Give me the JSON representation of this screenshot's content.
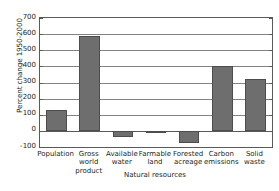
{
  "chart_data": {
    "type": "bar",
    "title": "",
    "subtitle": "",
    "xlabel": "",
    "ylabel": "Percent change 1950-2000",
    "ylim": [
      -100,
      700
    ],
    "ytick_step": 100,
    "yticks": [
      700,
      600,
      500,
      400,
      300,
      200,
      100,
      0,
      -100
    ],
    "ytick_labels": [
      "700",
      "600",
      "500",
      "400",
      "300",
      "200",
      "100",
      "0",
      "-100"
    ],
    "grid": true,
    "grid_axis": "y",
    "legend": false,
    "legend_position": "none",
    "categories": [
      "Population",
      "Gross world product",
      "Available water",
      "Farmable land",
      "Forested acreage",
      "Carbon emissions",
      "Solid waste"
    ],
    "category_label_lines": [
      [
        "Population"
      ],
      [
        "Gross",
        "world",
        "product"
      ],
      [
        "Available",
        "water"
      ],
      [
        "Farmable",
        "land"
      ],
      [
        "Forested",
        "acreage"
      ],
      [
        "Carbon",
        "emissions"
      ],
      [
        "Solid",
        "waste"
      ]
    ],
    "values": [
      130,
      590,
      -40,
      -15,
      -75,
      405,
      320
    ],
    "value_unit": "percent",
    "bar_color": "#6e6e6e",
    "bar_edge_color": "#4d4d4d",
    "axis_color": "#58595b",
    "grid_color": "#808285",
    "annotations": [
      {
        "type": "group-bracket",
        "label": "Natural resources",
        "covers": [
          "Available water",
          "Farmable land",
          "Forested acreage"
        ]
      }
    ]
  },
  "axis": {
    "y_title": "Percent change 1950-2000"
  },
  "group": {
    "label": "Natural resources"
  }
}
